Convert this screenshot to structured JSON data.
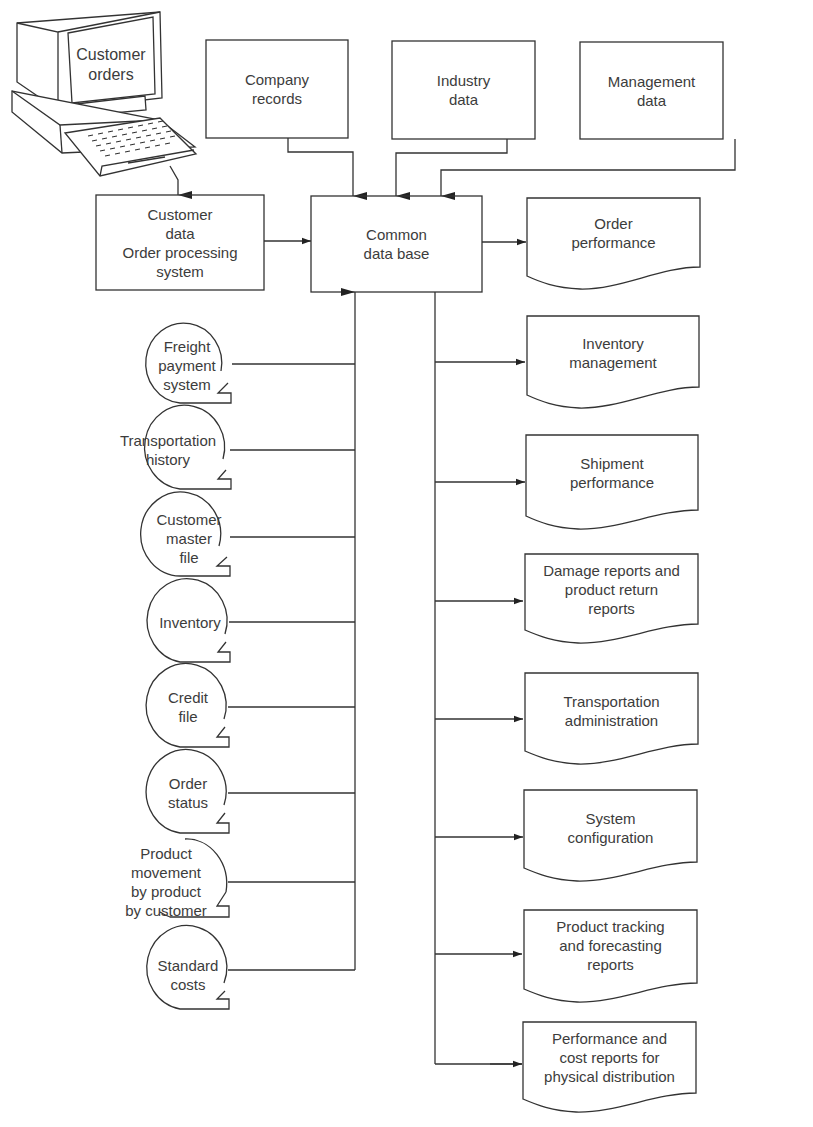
{
  "diagram": {
    "type": "data-flow",
    "central_node": {
      "id": "common_db",
      "lines": [
        "Common",
        "data base"
      ]
    },
    "terminal": {
      "id": "customer_orders",
      "icon": "computer-terminal-icon",
      "lines": [
        "Customer",
        "orders"
      ]
    },
    "order_processing": {
      "id": "order_processing",
      "lines": [
        "Customer",
        "data",
        "Order processing",
        "system"
      ]
    },
    "top_sources": [
      {
        "id": "company_records",
        "lines": [
          "Company",
          "records"
        ]
      },
      {
        "id": "industry_data",
        "lines": [
          "Industry",
          "data"
        ]
      },
      {
        "id": "management_data",
        "lines": [
          "Management",
          "data"
        ]
      }
    ],
    "files": [
      {
        "id": "freight_payment",
        "lines": [
          "Freight",
          "payment",
          "system"
        ]
      },
      {
        "id": "transportation_history",
        "lines": [
          "Transportation",
          "history"
        ]
      },
      {
        "id": "customer_master",
        "lines": [
          "Customer",
          "master",
          "file"
        ]
      },
      {
        "id": "inventory",
        "lines": [
          "Inventory"
        ]
      },
      {
        "id": "credit_file",
        "lines": [
          "Credit",
          "file"
        ]
      },
      {
        "id": "order_status",
        "lines": [
          "Order",
          "status"
        ]
      },
      {
        "id": "product_movement",
        "lines": [
          "Product",
          "movement",
          "by product",
          "by customer"
        ]
      },
      {
        "id": "standard_costs",
        "lines": [
          "Standard",
          "costs"
        ]
      }
    ],
    "reports": [
      {
        "id": "order_performance",
        "lines": [
          "Order",
          "performance"
        ]
      },
      {
        "id": "inventory_management",
        "lines": [
          "Inventory",
          "management"
        ]
      },
      {
        "id": "shipment_performance",
        "lines": [
          "Shipment",
          "performance"
        ]
      },
      {
        "id": "damage_reports",
        "lines": [
          "Damage reports and",
          "product return",
          "reports"
        ]
      },
      {
        "id": "transportation_admin",
        "lines": [
          "Transportation",
          "administration"
        ]
      },
      {
        "id": "system_configuration",
        "lines": [
          "System",
          "configuration"
        ]
      },
      {
        "id": "product_tracking",
        "lines": [
          "Product tracking",
          "and forecasting",
          "reports"
        ]
      },
      {
        "id": "performance_cost",
        "lines": [
          "Performance and",
          "cost reports for",
          "physical distribution"
        ]
      }
    ],
    "edges": [
      [
        "customer_orders",
        "order_processing"
      ],
      [
        "order_processing",
        "common_db"
      ],
      [
        "company_records",
        "common_db"
      ],
      [
        "industry_data",
        "common_db"
      ],
      [
        "management_data",
        "common_db"
      ],
      [
        "freight_payment",
        "common_db"
      ],
      [
        "transportation_history",
        "common_db"
      ],
      [
        "customer_master",
        "common_db"
      ],
      [
        "inventory",
        "common_db"
      ],
      [
        "credit_file",
        "common_db"
      ],
      [
        "order_status",
        "common_db"
      ],
      [
        "product_movement",
        "common_db"
      ],
      [
        "standard_costs",
        "common_db"
      ],
      [
        "common_db",
        "order_performance"
      ],
      [
        "common_db",
        "inventory_management"
      ],
      [
        "common_db",
        "shipment_performance"
      ],
      [
        "common_db",
        "damage_reports"
      ],
      [
        "common_db",
        "transportation_admin"
      ],
      [
        "common_db",
        "system_configuration"
      ],
      [
        "common_db",
        "product_tracking"
      ],
      [
        "common_db",
        "performance_cost"
      ]
    ]
  },
  "style": {
    "line_color": "#333333",
    "text_color": "#3c3c3c",
    "background": "#ffffff"
  }
}
